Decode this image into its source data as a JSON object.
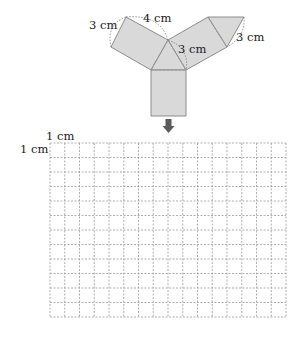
{
  "net": {
    "fill_color": "#d9d9d9",
    "stroke_color": "#8c8c8c",
    "labels": {
      "left_arm_short": "3 cm",
      "left_arm_long": "4 cm",
      "triangle_side": "3 cm",
      "right_arm_short": "3 cm"
    }
  },
  "arrow": {
    "color": "#5a5a5a",
    "direction": "down"
  },
  "grid": {
    "columns": 16,
    "rows": 12,
    "unit_label_x": "1 cm",
    "unit_label_y": "1 cm",
    "line_color": "#9a9a9a"
  }
}
